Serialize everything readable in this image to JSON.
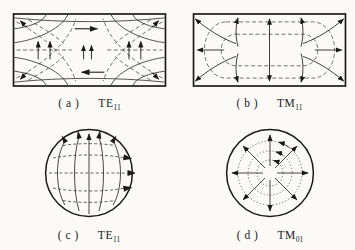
{
  "figure": {
    "ink_color": "#1a1a1a",
    "background_color": "#fbfaf7",
    "panels": [
      {
        "index_label": "( a )",
        "mode_label": "TE",
        "mode_subscript": "11"
      },
      {
        "index_label": "( b )",
        "mode_label": "TM",
        "mode_subscript": "11"
      },
      {
        "index_label": "( c )",
        "mode_label": "TE",
        "mode_subscript": "11"
      },
      {
        "index_label": "( d )",
        "mode_label": "TM",
        "mode_subscript": "01"
      }
    ]
  }
}
